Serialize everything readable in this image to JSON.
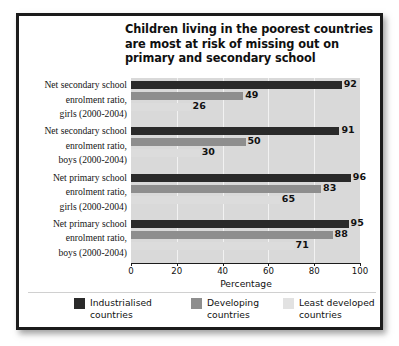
{
  "chart_data": {
    "type": "bar",
    "orientation": "horizontal",
    "title": "Children living in the poorest countries are most at risk of missing out on primary and secondary school",
    "title_lines": [
      "Children living in the poorest countries",
      "are most at risk of missing out on",
      "primary and secondary school"
    ],
    "xlabel": "Percentage",
    "ylabel": "",
    "xlim": [
      0,
      100
    ],
    "xticks": [
      0,
      20,
      40,
      60,
      80,
      100
    ],
    "xtick_labels": [
      "0",
      "20",
      "40",
      "60",
      "80",
      "100"
    ],
    "grid": true,
    "legend_position": "bottom",
    "categories": [
      "Net secondary school enrolment ratio, girls (2000-2004)",
      "Net secondary school enrolment ratio, boys (2000-2004)",
      "Net primary school enrolment ratio, girls (2000-2004)",
      "Net primary school enrolment ratio, boys (2000-2004)"
    ],
    "category_lines": [
      [
        "Net secondary school",
        "enrolment ratio,",
        "girls (2000-2004)"
      ],
      [
        "Net secondary school",
        "enrolment ratio,",
        "boys (2000-2004)"
      ],
      [
        "Net primary school",
        "enrolment ratio,",
        "girls (2000-2004)"
      ],
      [
        "Net primary school",
        "enrolment ratio,",
        "boys (2000-2004)"
      ]
    ],
    "series": [
      {
        "name": "Industrialised countries",
        "name_lines": [
          "Industrialised",
          "countries"
        ],
        "color": "#2a2a2a",
        "values": [
          92,
          91,
          96,
          95
        ]
      },
      {
        "name": "Developing countries",
        "name_lines": [
          "Developing",
          "countries"
        ],
        "color": "#8e8e8e",
        "values": [
          49,
          50,
          83,
          88
        ]
      },
      {
        "name": "Least developed countries",
        "name_lines": [
          "Least developed",
          "countries"
        ],
        "color": "#dcdcdc",
        "values": [
          26,
          30,
          65,
          71
        ]
      }
    ]
  },
  "colors": {
    "plot_background": "#d9d9d9",
    "gridline": "#f2f2f2",
    "frame": "#1b1b1b",
    "page_background": "#ffffff",
    "text": "#111111"
  }
}
